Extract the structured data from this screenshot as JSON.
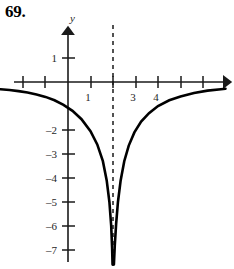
{
  "figure": {
    "problem_number": "69.",
    "axis_labels": {
      "y_axis": "y",
      "x_axis": ""
    }
  },
  "chart_data": {
    "type": "line",
    "title": "",
    "subtitle": "",
    "xlabel": "",
    "ylabel": "y",
    "xlim": [
      -3,
      7
    ],
    "ylim": [
      -7.6,
      1.6
    ],
    "grid": false,
    "legend": null,
    "x_ticks": [
      -2,
      -1,
      1,
      2,
      3,
      4,
      5,
      6
    ],
    "x_tick_labels": [
      "",
      "",
      "1",
      "",
      "3",
      "4",
      "",
      ""
    ],
    "y_ticks": [
      1,
      -2,
      -3,
      -4,
      -5,
      -6,
      -7
    ],
    "y_tick_labels": [
      "1",
      "–2",
      "–3",
      "–4",
      "–5",
      "–6",
      "–7"
    ],
    "annotations": [
      {
        "kind": "vertical-asymptote",
        "x": 2,
        "style": "dashed",
        "label": ""
      }
    ],
    "series": [
      {
        "name": "left-branch",
        "description": "Descends to negative infinity as x approaches 2 from the left; approaches y = 0 from below as x decreases.",
        "x": [
          -3.0,
          -2.6,
          -2.2,
          -1.8,
          -1.4,
          -1.0,
          -0.6,
          -0.2,
          0.2,
          0.6,
          1.0,
          1.3,
          1.55,
          1.72,
          1.84,
          1.92,
          1.96,
          1.98
        ],
        "y": [
          -0.3,
          -0.33,
          -0.38,
          -0.44,
          -0.52,
          -0.62,
          -0.76,
          -0.95,
          -1.2,
          -1.55,
          -2.05,
          -2.6,
          -3.3,
          -4.1,
          -5.0,
          -6.0,
          -6.9,
          -7.6
        ]
      },
      {
        "name": "right-branch",
        "description": "Rises from negative infinity just right of x = 2 and approaches y = 0 from below as x increases.",
        "x": [
          2.04,
          2.08,
          2.14,
          2.22,
          2.34,
          2.5,
          2.7,
          2.95,
          3.25,
          3.6,
          4.0,
          4.5,
          5.0,
          5.6,
          6.2,
          6.8,
          7.0
        ],
        "y": [
          -7.6,
          -6.8,
          -5.9,
          -5.0,
          -4.1,
          -3.3,
          -2.65,
          -2.1,
          -1.65,
          -1.3,
          -1.0,
          -0.76,
          -0.6,
          -0.46,
          -0.36,
          -0.3,
          -0.28
        ]
      }
    ]
  }
}
